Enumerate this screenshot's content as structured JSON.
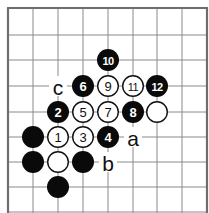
{
  "diagram": {
    "type": "go-board-fragment",
    "background": "#ffffff",
    "grid_color": "#8a8a8a",
    "edge_color": "#6e6e6e",
    "columns_x": [
      8,
      33,
      58,
      83,
      108,
      133,
      157,
      182,
      207
    ],
    "rows_y": [
      8,
      35,
      60,
      86,
      112,
      137,
      162,
      187,
      212
    ],
    "edges": {
      "top": true,
      "left": true,
      "right": true,
      "bottom": false
    },
    "stone_radius": 11,
    "stones": [
      {
        "col": 4,
        "row": 2,
        "color": "black",
        "label": "10"
      },
      {
        "col": 3,
        "row": 3,
        "color": "black",
        "label": "6"
      },
      {
        "col": 4,
        "row": 3,
        "color": "white",
        "label": "9"
      },
      {
        "col": 5,
        "row": 3,
        "color": "white",
        "label": "11"
      },
      {
        "col": 6,
        "row": 3,
        "color": "black",
        "label": "12"
      },
      {
        "col": 2,
        "row": 4,
        "color": "black",
        "label": "2"
      },
      {
        "col": 3,
        "row": 4,
        "color": "white",
        "label": "5"
      },
      {
        "col": 4,
        "row": 4,
        "color": "white",
        "label": "7"
      },
      {
        "col": 5,
        "row": 4,
        "color": "black",
        "label": "8"
      },
      {
        "col": 6,
        "row": 4,
        "color": "white",
        "label": ""
      },
      {
        "col": 1,
        "row": 5,
        "color": "black",
        "label": ""
      },
      {
        "col": 2,
        "row": 5,
        "color": "white",
        "label": "1"
      },
      {
        "col": 3,
        "row": 5,
        "color": "white",
        "label": "3"
      },
      {
        "col": 4,
        "row": 5,
        "color": "black",
        "label": "4"
      },
      {
        "col": 1,
        "row": 6,
        "color": "black",
        "label": ""
      },
      {
        "col": 2,
        "row": 6,
        "color": "white",
        "label": ""
      },
      {
        "col": 3,
        "row": 6,
        "color": "black",
        "label": ""
      },
      {
        "col": 2,
        "row": 7,
        "color": "black",
        "label": ""
      }
    ],
    "marks": [
      {
        "col": 2,
        "row": 3,
        "text": "c"
      },
      {
        "col": 5,
        "row": 5,
        "text": "a"
      },
      {
        "col": 4,
        "row": 6,
        "text": "b"
      }
    ]
  }
}
